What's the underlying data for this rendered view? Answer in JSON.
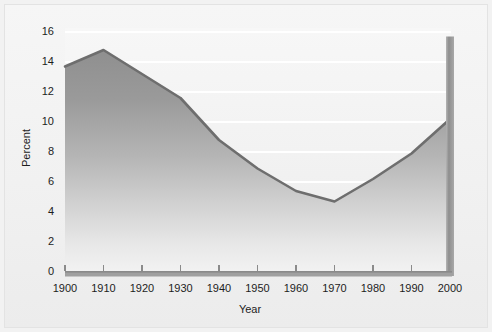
{
  "chart_data": {
    "type": "area",
    "title": "",
    "xlabel": "Year",
    "ylabel": "Percent",
    "x": [
      1900,
      1910,
      1920,
      1930,
      1940,
      1950,
      1960,
      1970,
      1980,
      1990,
      2000
    ],
    "values": [
      13.7,
      14.8,
      13.2,
      11.6,
      8.8,
      6.9,
      5.4,
      4.7,
      6.2,
      7.9,
      10.2
    ],
    "series": [
      {
        "name": "Percent",
        "values": [
          13.7,
          14.8,
          13.2,
          11.6,
          8.8,
          6.9,
          5.4,
          4.7,
          6.2,
          7.9,
          10.2
        ]
      }
    ],
    "xlim": [
      1900,
      2000
    ],
    "ylim": [
      0,
      16
    ],
    "xticks": [
      1900,
      1910,
      1920,
      1930,
      1940,
      1950,
      1960,
      1970,
      1980,
      1990,
      2000
    ],
    "xtick_labels": [
      "1900",
      "1910",
      "1920",
      "1930",
      "1940",
      "1950",
      "1960",
      "1970",
      "1980",
      "1990",
      "2000"
    ],
    "yticks": [
      0,
      2,
      4,
      6,
      8,
      10,
      12,
      14,
      16
    ],
    "ytick_labels": [
      "0",
      "2",
      "4",
      "6",
      "8",
      "10",
      "12",
      "14",
      "16"
    ],
    "grid": "horizontal",
    "legend": "none",
    "annotations": [
      {
        "name": "right-axis-bar",
        "description": "vertical gray bar at year 2000 spanning 0 to 15.7",
        "x": 2000,
        "y_top": 15.7,
        "y_bottom": 0
      }
    ]
  },
  "style": {
    "line_color": "#6b6b6b",
    "fill_top_color": "#949494",
    "fill_bottom_color": "#f0f0f0",
    "gridline_color": "#ffffff",
    "axis_bar_color": "#9a9a9a",
    "background_color": "#f2f2f2",
    "plot_background_top": "#f6f6f6",
    "plot_background_bottom": "#ececec",
    "tick_text_color": "#1d1d1d",
    "frame_border_color": "#e3e3e3"
  },
  "axes": {
    "x_axis_name": "Year",
    "y_axis_name": "Percent"
  }
}
